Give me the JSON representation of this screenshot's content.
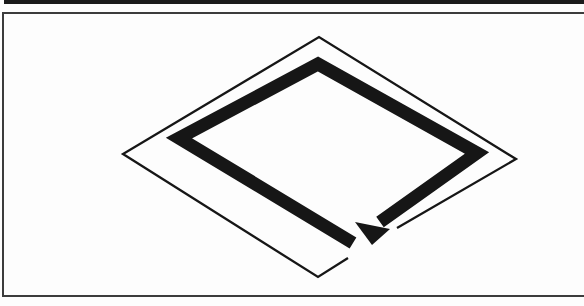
{
  "colors": {
    "background": "#fdfdfd",
    "paper": "#fdfdfd",
    "ink": "#161616",
    "frame_line": "#3c3c3c",
    "edge_bar": "#1b1b1b"
  },
  "edge_bar": {
    "x": 4,
    "y": 0,
    "width": 580,
    "height": 4
  },
  "frame": {
    "stroke_width": 2,
    "right_side_open": true,
    "points": [
      [
        585,
        13
      ],
      [
        3,
        13
      ],
      [
        3,
        296
      ],
      [
        585,
        296
      ]
    ]
  },
  "figure": {
    "outline": {
      "shape": "rhombus-open-polyline",
      "stroke_width": 2.3,
      "gap_on_edge": "bottom-right",
      "points": [
        [
          397,
          228
        ],
        [
          516,
          159
        ],
        [
          319,
          37
        ],
        [
          123,
          154
        ],
        [
          318,
          277
        ],
        [
          348,
          258
        ]
      ]
    },
    "arrow": {
      "direction": "clockwise",
      "stroke_width": 13,
      "spine": [
        [
          353,
          243
        ],
        [
          179,
          138
        ],
        [
          318,
          64
        ],
        [
          477,
          153
        ],
        [
          380,
          222
        ]
      ],
      "head": [
        [
          372,
          245
        ],
        [
          355,
          222
        ],
        [
          390,
          229
        ]
      ]
    }
  }
}
